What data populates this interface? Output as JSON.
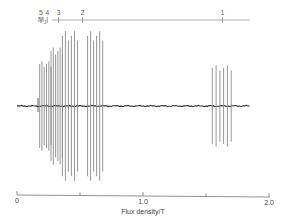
{
  "chart_data": {
    "type": "line",
    "title": "",
    "subtitle": "ESR-like spectrum with hyperfine groups labelled by M_J",
    "xlabel": "Flux density/T",
    "ylabel": "",
    "xlim": [
      0,
      2.0
    ],
    "x_ticks": [
      "0",
      "1.0",
      "2.0"
    ],
    "x_minor_ticks": [
      0.5,
      1.5
    ],
    "grid": false,
    "legend": null,
    "top_scale": {
      "label": "M",
      "label_sub": "J",
      "markers": [
        {
          "label": "5",
          "x": 0.19
        },
        {
          "label": "4",
          "x": 0.24
        },
        {
          "label": "3",
          "x": 0.33
        },
        {
          "label": "2",
          "x": 0.52
        },
        {
          "label": "1",
          "x": 1.63
        }
      ]
    },
    "baseline_y": 0,
    "line_groups": [
      {
        "mj": 5,
        "x_range": [
          0.18,
          0.27
        ],
        "count": 6,
        "amplitude": 0.55
      },
      {
        "mj": 4,
        "x_range": [
          0.27,
          0.36
        ],
        "count": 6,
        "amplitude": 0.72
      },
      {
        "mj": 3,
        "x_range": [
          0.36,
          0.48
        ],
        "count": 6,
        "amplitude": 0.92
      },
      {
        "mj": 2,
        "x_range": [
          0.56,
          0.68
        ],
        "count": 6,
        "amplitude": 0.92
      },
      {
        "mj": 1,
        "x_range": [
          1.55,
          1.7
        ],
        "count": 6,
        "amplitude": 0.5
      }
    ]
  }
}
